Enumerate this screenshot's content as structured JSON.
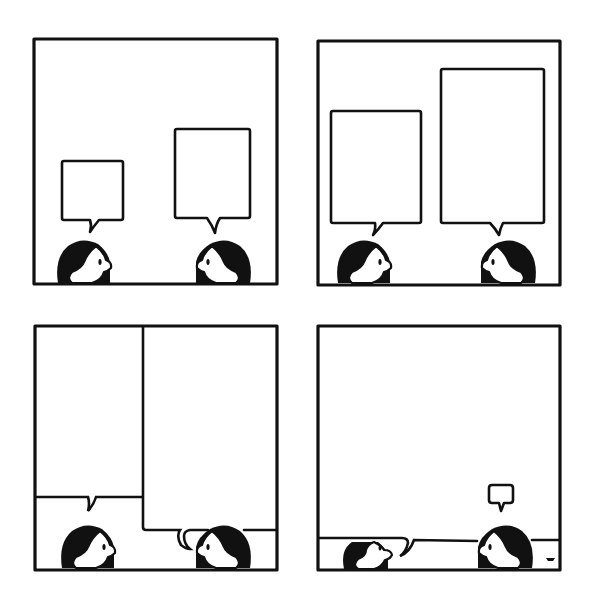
{
  "comic": {
    "title": "",
    "layout": "2x2 grid",
    "panel_count": 4,
    "colors": {
      "ink": "#111111",
      "paper": "#ffffff"
    },
    "panels": [
      {
        "index": 1,
        "description": "Two characters face each other at the bottom of the panel; each has an empty speech bubble, the right one larger.",
        "dialogue": [
          "",
          ""
        ]
      },
      {
        "index": 2,
        "description": "Both empty speech bubbles have grown much taller; the right one is the largest.",
        "dialogue": [
          "",
          ""
        ]
      },
      {
        "index": 3,
        "description": "The speech bubbles fill the panel and push against each other; the right bubble squeezes the left one.",
        "dialogue": [
          "",
          ""
        ]
      },
      {
        "index": 4,
        "description": "The left character's bubble fills almost the entire panel, squashing the right character down; the right character has a tiny empty bubble.",
        "dialogue": [
          "",
          ""
        ]
      }
    ],
    "signature": "artist mark"
  }
}
